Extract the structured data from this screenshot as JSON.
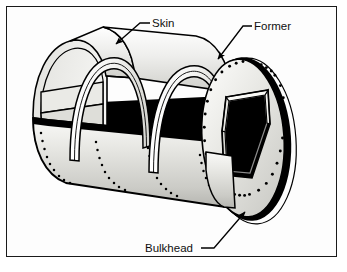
{
  "figure": {
    "background_color": "#ffffff",
    "frame_color": "#1a1a1a",
    "line_color": "#000000",
    "shadow_color": "#000000",
    "skin_fill_light": "#f2f2f0",
    "skin_fill_mid": "#d8d8d4",
    "skin_fill_dark": "#bdbdb8",
    "bulkhead_fill": "#e4e4e0",
    "former_fill": "#ffffff"
  },
  "labels": [
    {
      "id": "skin",
      "text": "Skin",
      "text_x": 152,
      "text_y": 27,
      "leader_from_x": 148,
      "leader_from_y": 23,
      "leader_to_x": 114,
      "leader_to_y": 46,
      "arrow": true,
      "arrow_angle_deg": 214
    },
    {
      "id": "former",
      "text": "Former",
      "text_x": 254,
      "text_y": 30,
      "leader_from_x": 250,
      "leader_from_y": 26,
      "leader_to_x": 216,
      "leader_to_y": 61,
      "arrow": true,
      "arrow_angle_deg": 226
    },
    {
      "id": "bulkhead",
      "text": "Bulkhead",
      "text_x": 145,
      "text_y": 252,
      "leader_from_x": 202,
      "leader_from_y": 248,
      "leader_to_x": 247,
      "leader_to_y": 210,
      "arrow": true,
      "arrow_angle_deg": 320
    }
  ],
  "parts": {
    "skin": {
      "name": "Skin",
      "description": "Outer stressed sheet metal covering of the fuselage",
      "rivet_rows": 4,
      "rivets_per_row": 9
    },
    "formers": {
      "name": "Former",
      "description": "Internal arch-shaped transverse frame hoops",
      "count": 2
    },
    "bulkhead": {
      "name": "Bulkhead",
      "description": "Heavy circular end frame with central cutout and rivet ring",
      "rivet_count": 34,
      "cutout_shape": "hexagonal"
    }
  }
}
